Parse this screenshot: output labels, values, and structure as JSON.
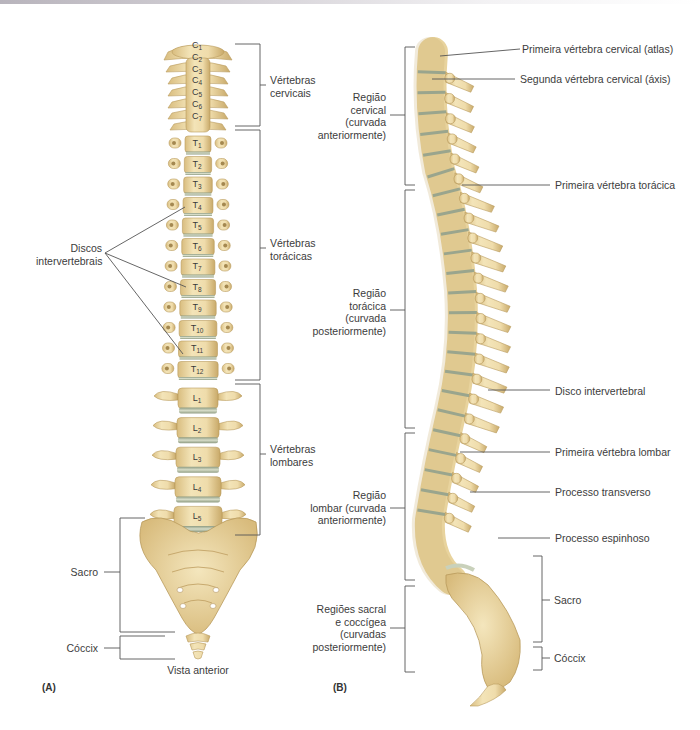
{
  "colors": {
    "bone": "#ecd9a6",
    "bone_shadow": "#c9ad70",
    "bone_dark": "#a98a4d",
    "disc": "#b9c3a8",
    "disc_dark": "#8c9a80",
    "line": "#5a5a5a"
  },
  "panel_a": {
    "letter": "(A)",
    "caption": "Vista anterior",
    "vertebrae": {
      "cervical": [
        "C1",
        "C2",
        "C3",
        "C4",
        "C5",
        "C6",
        "C7"
      ],
      "thoracic": [
        "T1",
        "T2",
        "T3",
        "T4",
        "T5",
        "T6",
        "T7",
        "T8",
        "T9",
        "T10",
        "T11",
        "T12"
      ],
      "lumbar": [
        "L1",
        "L2",
        "L3",
        "L4",
        "L5"
      ]
    },
    "labels": {
      "cervicais_l1": "Vértebras",
      "cervicais_l2": "cervicais",
      "toracicas_l1": "Vértebras",
      "toracicas_l2": "torácicas",
      "lombares_l1": "Vértebras",
      "lombares_l2": "lombares",
      "discos_l1": "Discos",
      "discos_l2": "intervertebrais",
      "sacro": "Sacro",
      "coccix": "Cóccix"
    }
  },
  "panel_b": {
    "letter": "(B)",
    "left_labels": {
      "cervical": [
        "Região",
        "cervical",
        "(curvada",
        "anteriormente)"
      ],
      "toracica": [
        "Região",
        "torácica",
        "(curvada",
        "posteriormente)"
      ],
      "lombar": [
        "Região",
        "lombar (curvada",
        "anteriormente)"
      ],
      "sacral": [
        "Regiões sacral",
        "e coccígea",
        "(curvadas",
        "posteriormente)"
      ]
    },
    "right_labels": {
      "atlas": "Primeira vértebra cervical (atlas)",
      "axis": "Segunda vértebra cervical (áxis)",
      "primeira_toracica": "Primeira vértebra torácica",
      "disco": "Disco intervertebral",
      "primeira_lombar": "Primeira vértebra lombar",
      "transverso": "Processo transverso",
      "espinhoso": "Processo espinhoso",
      "sacro": "Sacro",
      "coccix": "Cóccix"
    }
  }
}
